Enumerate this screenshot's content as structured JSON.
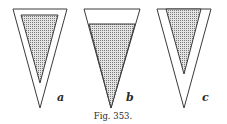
{
  "figure": {
    "caption": "Fig. 353.",
    "panels": [
      {
        "label": "a",
        "description": "inverted cone with shaded inner triangle separated from walls"
      },
      {
        "label": "b",
        "description": "inverted cone partially filled with shaded region up to a level"
      },
      {
        "label": "c",
        "description": "inverted cone with shaded inner triangle touching top edge"
      }
    ]
  },
  "colors": {
    "stroke": "#3a3a3a",
    "fill_dots": "#8a8a8a",
    "background": "#ffffff"
  }
}
